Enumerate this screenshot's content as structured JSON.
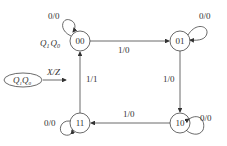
{
  "diagram": {
    "type": "state-transition",
    "legend": {
      "state_label": "Q1Q0",
      "state_sub": [
        "1",
        "0"
      ],
      "arrow_label": "X/Z"
    },
    "state_var_label": {
      "q1": "Q",
      "s1": "1",
      "q0": "Q",
      "s0": "0"
    },
    "states": [
      {
        "id": "00",
        "label": "00"
      },
      {
        "id": "01",
        "label": "01"
      },
      {
        "id": "10",
        "label": "10"
      },
      {
        "id": "11",
        "label": "11"
      }
    ],
    "transitions": [
      {
        "from": "00",
        "to": "00",
        "label": "0/0"
      },
      {
        "from": "00",
        "to": "01",
        "label": "1/0"
      },
      {
        "from": "01",
        "to": "01",
        "label": "0/0"
      },
      {
        "from": "01",
        "to": "10",
        "label": "1/0"
      },
      {
        "from": "10",
        "to": "10",
        "label": "0/0"
      },
      {
        "from": "10",
        "to": "11",
        "label": "1/0"
      },
      {
        "from": "11",
        "to": "11",
        "label": "0/0"
      },
      {
        "from": "11",
        "to": "00",
        "label": "1/1"
      }
    ]
  }
}
